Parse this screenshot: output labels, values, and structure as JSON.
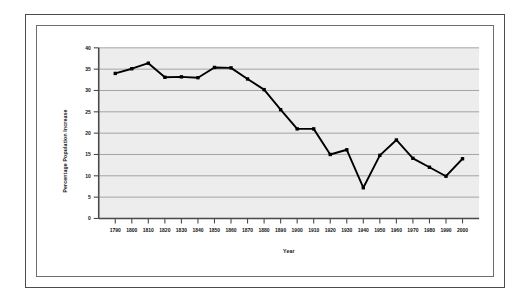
{
  "figure": {
    "background_color": "#ffffff",
    "outer_border_color": "#4b4b4b",
    "inner_border_color": "#6e6e6e"
  },
  "chart_data": {
    "type": "line",
    "title": "",
    "xlabel": "Year",
    "ylabel": "Percentage Population Increase",
    "xlim": [
      1785,
      2005
    ],
    "ylim": [
      0,
      40
    ],
    "ytick_step": 5,
    "grid": "horizontal",
    "legend": "none",
    "plot_bg_color": "#ededed",
    "gridline_color": "#9a9a9a",
    "line_color": "#000000",
    "marker": "square",
    "marker_color": "#000000",
    "categories": [
      "1790",
      "1800",
      "1810",
      "1820",
      "1830",
      "1840",
      "1850",
      "1860",
      "1870",
      "1880",
      "1890",
      "1900",
      "1910",
      "1920",
      "1930",
      "1940",
      "1950",
      "1960",
      "1970",
      "1980",
      "1990",
      "2000"
    ],
    "x": [
      1790,
      1800,
      1810,
      1820,
      1830,
      1840,
      1850,
      1860,
      1870,
      1880,
      1890,
      1900,
      1910,
      1920,
      1930,
      1940,
      1950,
      1960,
      1970,
      1980,
      1990,
      2000
    ],
    "values": [
      34.0,
      35.1,
      36.4,
      33.1,
      33.2,
      33.0,
      35.4,
      35.3,
      32.7,
      30.2,
      25.5,
      21.0,
      21.0,
      15.0,
      16.1,
      7.2,
      14.8,
      18.4,
      14.1,
      12.0,
      9.9,
      14.0
    ],
    "yticks": [
      0,
      5,
      10,
      15,
      20,
      25,
      30,
      35,
      40
    ],
    "ytick_labels": [
      "0",
      "5",
      "10",
      "15",
      "20",
      "25",
      "30",
      "35",
      "40"
    ]
  }
}
